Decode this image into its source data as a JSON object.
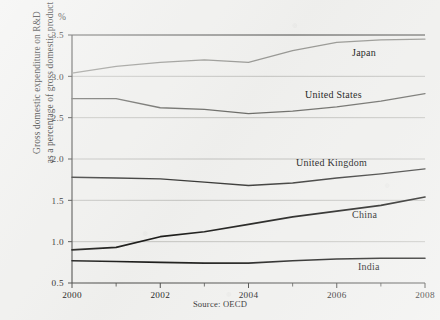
{
  "figure": {
    "unit_symbol": "%",
    "y_axis_title_line1": "Gross domestic expenditure on R&D",
    "y_axis_title_line2": "as a percentage of gross domestic product",
    "source_note": "Source: OECD"
  },
  "chart_data": {
    "type": "line",
    "title": "",
    "xlabel": "",
    "ylabel": "Gross domestic expenditure on R&D as a percentage of gross domestic product",
    "unit": "%",
    "grid": true,
    "legend_position": "inline-labels",
    "xlim": [
      2000,
      2008
    ],
    "ylim": [
      0.5,
      3.5
    ],
    "ytick_labels": [
      "0.5",
      "1.0",
      "1.5",
      "2.0",
      "2.5",
      "3.0",
      "3.5"
    ],
    "ytick_values": [
      0.5,
      1.0,
      1.5,
      2.0,
      2.5,
      3.0,
      3.5
    ],
    "xtick_labels": [
      "2000",
      "2002",
      "2004",
      "2006",
      "2008"
    ],
    "xtick_values": [
      2000,
      2002,
      2004,
      2006,
      2008
    ],
    "x_minor_ticks": [
      2001,
      2003,
      2005,
      2007
    ],
    "x": [
      2000,
      2001,
      2002,
      2003,
      2004,
      2005,
      2006,
      2007,
      2008
    ],
    "series": [
      {
        "name": "Japan",
        "color": "#9a9a96",
        "width": 1.3,
        "values": [
          3.04,
          3.12,
          3.17,
          3.2,
          3.17,
          3.31,
          3.41,
          3.44,
          3.45
        ],
        "label_x": 352,
        "label_y": 47
      },
      {
        "name": "United States",
        "color": "#6e6e6a",
        "width": 1.3,
        "values": [
          2.73,
          2.73,
          2.62,
          2.6,
          2.55,
          2.58,
          2.63,
          2.7,
          2.79
        ],
        "label_x": 305,
        "label_y": 89
      },
      {
        "name": "United Kingdom",
        "color": "#3a3a38",
        "width": 1.4,
        "values": [
          1.78,
          1.77,
          1.76,
          1.72,
          1.68,
          1.71,
          1.77,
          1.82,
          1.88
        ],
        "label_x": 296,
        "label_y": 157
      },
      {
        "name": "China",
        "color": "#1c1c1a",
        "width": 1.7,
        "values": [
          0.9,
          0.93,
          1.06,
          1.12,
          1.21,
          1.3,
          1.37,
          1.44,
          1.54
        ],
        "label_x": 352,
        "label_y": 209
      },
      {
        "name": "India",
        "color": "#1c1c1a",
        "width": 1.6,
        "values": [
          0.77,
          0.76,
          0.75,
          0.74,
          0.74,
          0.77,
          0.79,
          0.8,
          0.8
        ],
        "label_x": 358,
        "label_y": 261
      }
    ]
  }
}
